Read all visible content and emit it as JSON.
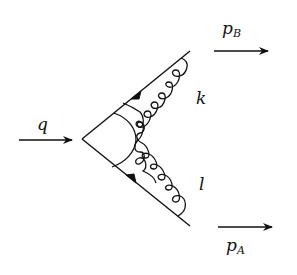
{
  "diagram": {
    "type": "feynman-diagram",
    "stroke_color": "#111111",
    "background": "#ffffff",
    "labels": {
      "q": "q",
      "pB_main": "p",
      "pB_sub": "B",
      "pA_main": "p",
      "pA_sub": "A",
      "k": "k",
      "l": "l"
    },
    "momenta": [
      {
        "name": "q",
        "direction": "incoming"
      },
      {
        "name": "p_B",
        "direction": "outgoing"
      },
      {
        "name": "p_A",
        "direction": "outgoing"
      }
    ],
    "loop_momenta": [
      "k",
      "l"
    ],
    "fermion_lines": [
      {
        "from": "vertex",
        "to": "upper-right",
        "label": "p_B leg"
      },
      {
        "from": "vertex",
        "to": "lower-right",
        "label": "p_A leg"
      }
    ],
    "gluons": [
      {
        "label": "k",
        "connects": "upper leg to lower leg (crossed)"
      },
      {
        "label": "l",
        "connects": "lower leg to upper leg (crossed)"
      }
    ]
  }
}
